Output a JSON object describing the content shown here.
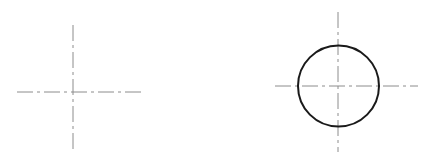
{
  "diagram": {
    "title": "",
    "figures": [
      {
        "id": "crosshair-only",
        "elements": [
          "horizontal-center-line",
          "vertical-center-line"
        ]
      },
      {
        "id": "circle-with-crosshair",
        "elements": [
          "circle",
          "horizontal-center-line",
          "vertical-center-line"
        ]
      }
    ],
    "colors": {
      "center_line": "#8c8c8c",
      "outline": "#1a1a1a",
      "background": "#ffffff"
    }
  }
}
